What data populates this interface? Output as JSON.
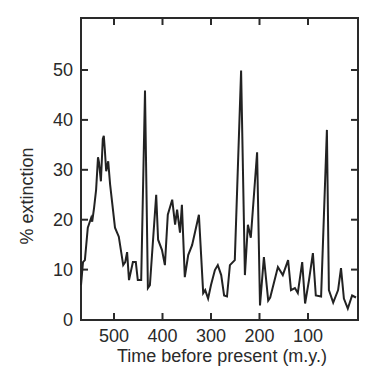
{
  "chart_data": {
    "type": "line",
    "title": "",
    "xlabel": "Time before present (m.y.)",
    "ylabel": "% extinction",
    "xlim": [
      570,
      0
    ],
    "ylim": [
      0,
      60
    ],
    "x_reversed": true,
    "grid": false,
    "legend": null,
    "xticks": [
      500,
      400,
      300,
      200,
      100
    ],
    "xtick_labels": [
      "500",
      "400",
      "300",
      "200",
      "100"
    ],
    "yticks": [
      0,
      10,
      20,
      30,
      40,
      50
    ],
    "ytick_labels": [
      "0",
      "10",
      "20",
      "30",
      "40",
      "50"
    ],
    "series": [
      {
        "name": "% extinction",
        "color": "#222222",
        "x": [
          568,
          564,
          560,
          554,
          547,
          545,
          541,
          537,
          533,
          531,
          527,
          523,
          521,
          519,
          516,
          512,
          508,
          498,
          490,
          481,
          477,
          473,
          469,
          461,
          455,
          451,
          444,
          436,
          430,
          426,
          413,
          409,
          401,
          395,
          389,
          380,
          374,
          370,
          364,
          360,
          354,
          347,
          339,
          331,
          325,
          316,
          312,
          306,
          300,
          292,
          286,
          279,
          273,
          267,
          261,
          251,
          238,
          230,
          224,
          218,
          205,
          199,
          191,
          182,
          178,
          162,
          152,
          141,
          135,
          127,
          121,
          112,
          106,
          98,
          90,
          84,
          73,
          61,
          57,
          48,
          38,
          32,
          26,
          18,
          9,
          1
        ],
        "y": [
          6.9,
          11.5,
          11.9,
          18.4,
          20.4,
          19.6,
          22.4,
          26,
          32.5,
          31.5,
          27.7,
          36.2,
          36.8,
          34.1,
          29.7,
          31.7,
          27.1,
          18.4,
          16.6,
          10.9,
          11.5,
          13.5,
          7.9,
          11.5,
          11.5,
          7.9,
          7.9,
          45.9,
          6.3,
          6.9,
          25,
          16,
          13.9,
          10.9,
          21,
          24,
          19,
          22,
          17.4,
          23,
          8.5,
          12.9,
          14.9,
          18.4,
          21,
          5.3,
          5.9,
          4.2,
          6.9,
          9.9,
          10.9,
          8.9,
          4.8,
          4.6,
          10.9,
          11.9,
          49.9,
          8.9,
          19,
          16.4,
          33.5,
          2.8,
          12.5,
          3.8,
          4.4,
          10.5,
          8.9,
          11.9,
          5.9,
          6.3,
          5.3,
          11.5,
          3.2,
          7.9,
          13.3,
          4.8,
          4.6,
          38,
          5.9,
          3.4,
          5.9,
          10.3,
          4.2,
          2.2,
          4.8,
          4.4
        ]
      }
    ]
  }
}
